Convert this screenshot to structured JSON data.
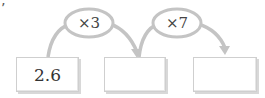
{
  "corner_mark": "’",
  "operations": [
    {
      "label": "×3",
      "operator": "×",
      "operand": 3
    },
    {
      "label": "×7",
      "operator": "×",
      "operand": 7
    }
  ],
  "boxes": [
    {
      "value": "2.6"
    },
    {
      "value": ""
    },
    {
      "value": ""
    }
  ],
  "colors": {
    "stroke": "#c4c4c4",
    "ellipse_fill": "#ffffff",
    "text": "#333333"
  }
}
